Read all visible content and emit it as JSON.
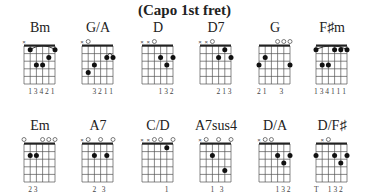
{
  "title": "(Capo 1st fret)",
  "chords": [
    {
      "name": "Bm",
      "x": 12,
      "y": 20,
      "open": [
        "x",
        "",
        "",
        "",
        "",
        ""
      ],
      "barre": [
        1,
        1,
        5
      ],
      "dots": [
        [
          1,
          1
        ],
        [
          3,
          2
        ],
        [
          3,
          3
        ],
        [
          2,
          4
        ],
        [
          1,
          5
        ]
      ],
      "fingers": "1 3 4 2 1",
      "fingers_offset": 1
    },
    {
      "name": "G/A",
      "x": 70,
      "y": 20,
      "open": [
        "x",
        "o",
        "",
        "",
        "",
        ""
      ],
      "barre": [
        2,
        4,
        5
      ],
      "dots": [
        [
          4,
          1
        ],
        [
          3,
          2
        ],
        [
          2,
          4
        ],
        [
          2,
          5
        ]
      ],
      "fingers": "3 2 1 1",
      "fingers_offset": 2
    },
    {
      "name": "D",
      "x": 130,
      "y": 20,
      "open": [
        "x",
        "x",
        "o",
        "",
        "",
        ""
      ],
      "dots": [
        [
          2,
          3
        ],
        [
          3,
          4
        ],
        [
          2,
          5
        ]
      ],
      "fingers": "1 3 2",
      "fingers_offset": 3
    },
    {
      "name": "D7",
      "x": 188,
      "y": 20,
      "open": [
        "x",
        "x",
        "o",
        "",
        "",
        ""
      ],
      "dots": [
        [
          2,
          3
        ],
        [
          1,
          4
        ],
        [
          2,
          5
        ]
      ],
      "fingers": "2 1 3",
      "fingers_offset": 3
    },
    {
      "name": "G",
      "x": 247,
      "y": 20,
      "open": [
        "",
        "",
        "",
        "o",
        "o",
        "o"
      ],
      "dots": [
        [
          3,
          0
        ],
        [
          2,
          1
        ],
        [
          3,
          5
        ]
      ],
      "fingers": "2 1       3",
      "fingers_offset": 0
    },
    {
      "name": "F♯m",
      "x": 304,
      "y": 20,
      "open": [
        "",
        "",
        "",
        "",
        "",
        ""
      ],
      "barre": [
        1,
        0,
        5
      ],
      "dots": [
        [
          1,
          0
        ],
        [
          3,
          1
        ],
        [
          3,
          2
        ],
        [
          1,
          3
        ],
        [
          1,
          4
        ],
        [
          1,
          5
        ]
      ],
      "fingers": "1 3 4 1 1 1",
      "fingers_offset": 0
    },
    {
      "name": "Em",
      "x": 12,
      "y": 118,
      "open": [
        "o",
        "",
        "",
        "o",
        "o",
        "o"
      ],
      "dots": [
        [
          2,
          1
        ],
        [
          2,
          2
        ]
      ],
      "fingers": "2 3",
      "fingers_offset": 1
    },
    {
      "name": "A7",
      "x": 70,
      "y": 118,
      "open": [
        "x",
        "o",
        "",
        "o",
        "",
        "o"
      ],
      "dots": [
        [
          2,
          2
        ],
        [
          2,
          4
        ]
      ],
      "fingers": "2   3",
      "fingers_offset": 2
    },
    {
      "name": "C/D",
      "x": 130,
      "y": 118,
      "open": [
        "x",
        "x",
        "o",
        "o",
        "",
        "o"
      ],
      "dots": [
        [
          1,
          4
        ]
      ],
      "fingers": "1",
      "fingers_offset": 4
    },
    {
      "name": "A7sus4",
      "x": 188,
      "y": 118,
      "open": [
        "x",
        "o",
        "",
        "o",
        "",
        "o"
      ],
      "dots": [
        [
          2,
          2
        ],
        [
          4,
          4
        ]
      ],
      "fingers": "1   3",
      "fingers_offset": 2
    },
    {
      "name": "D/A",
      "x": 247,
      "y": 118,
      "open": [
        "x",
        "o",
        "o",
        "",
        "",
        ""
      ],
      "dots": [
        [
          2,
          3
        ],
        [
          3,
          4
        ],
        [
          2,
          5
        ]
      ],
      "fingers": "1 3 2",
      "fingers_offset": 3
    },
    {
      "name": "D/F♯",
      "x": 304,
      "y": 118,
      "open": [
        "",
        "x",
        "o",
        "",
        "",
        ""
      ],
      "dots": [
        [
          2,
          0
        ],
        [
          2,
          3
        ],
        [
          3,
          4
        ],
        [
          2,
          5
        ]
      ],
      "fingers": "T     1 3 2",
      "fingers_offset": 0
    }
  ]
}
